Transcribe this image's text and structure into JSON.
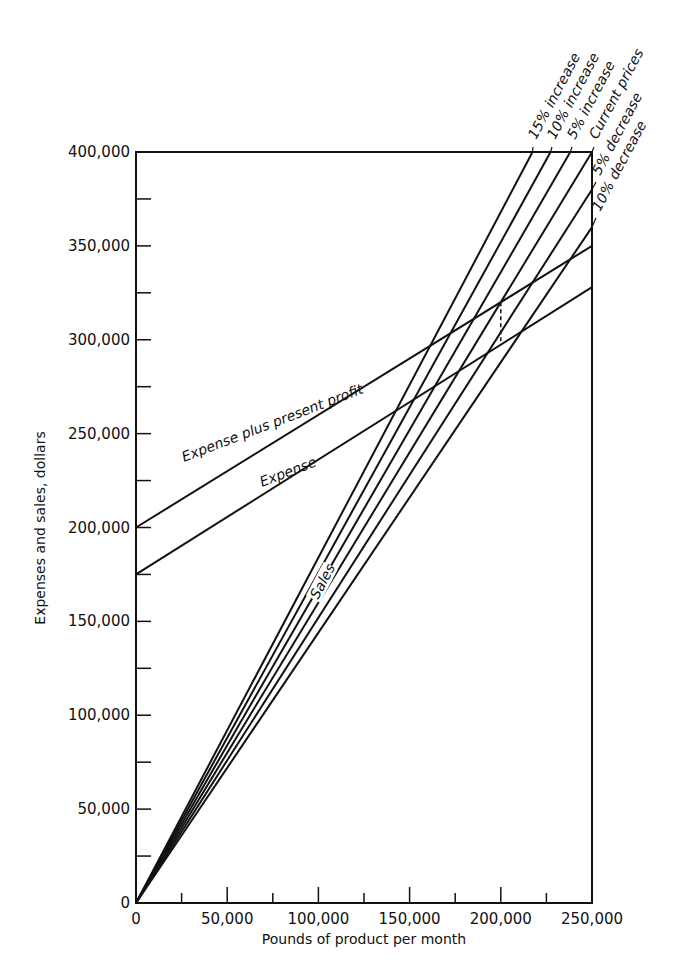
{
  "chart_data": {
    "type": "line",
    "title": "",
    "xlabel": "Pounds of product per month",
    "ylabel": "Expenses and sales, dollars",
    "xlim": [
      0,
      250000
    ],
    "ylim": [
      0,
      400000
    ],
    "grid": false,
    "x_ticks_major": [
      0,
      50000,
      100000,
      150000,
      200000,
      250000
    ],
    "x_tick_labels": [
      "0",
      "50,000",
      "100,000",
      "150,000",
      "200,000",
      "250,000"
    ],
    "x_ticks_minor": [
      25000,
      75000,
      125000,
      175000,
      225000
    ],
    "y_ticks_major": [
      0,
      50000,
      100000,
      150000,
      200000,
      250000,
      300000,
      350000,
      400000
    ],
    "y_tick_labels": [
      "0",
      "50,000",
      "100,000",
      "150,000",
      "200,000",
      "250,000",
      "300,000",
      "350,000",
      "400,000"
    ],
    "y_ticks_minor": [
      25000,
      75000,
      125000,
      175000,
      225000,
      275000,
      325000,
      375000
    ],
    "series": [
      {
        "name": "15% increase",
        "group": "Sales",
        "x": [
          0,
          217391
        ],
        "y": [
          0,
          400000
        ]
      },
      {
        "name": "10% increase",
        "group": "Sales",
        "x": [
          0,
          227273
        ],
        "y": [
          0,
          400000
        ]
      },
      {
        "name": "5% increase",
        "group": "Sales",
        "x": [
          0,
          238095
        ],
        "y": [
          0,
          400000
        ]
      },
      {
        "name": "Current prices",
        "group": "Sales",
        "x": [
          0,
          250000
        ],
        "y": [
          0,
          400000
        ]
      },
      {
        "name": "5% decrease",
        "group": "Sales",
        "x": [
          0,
          250000
        ],
        "y": [
          0,
          380000
        ]
      },
      {
        "name": "10% decrease",
        "group": "Sales",
        "x": [
          0,
          250000
        ],
        "y": [
          0,
          360000
        ]
      },
      {
        "name": "Expense plus present profit",
        "x": [
          0,
          250000
        ],
        "y": [
          200000,
          350000
        ]
      },
      {
        "name": "Expense",
        "x": [
          0,
          250000
        ],
        "y": [
          175000,
          328000
        ]
      }
    ],
    "annotations": [
      {
        "text": "Sales",
        "target": "sales line group"
      },
      {
        "text": "Expense plus present profit",
        "target": "Expense plus present profit"
      },
      {
        "text": "Expense",
        "target": "Expense"
      },
      {
        "type": "dashed-vertical",
        "x": 200000,
        "y": [
          299000,
          320000
        ],
        "meaning": "present profit at 200,000 lb"
      }
    ],
    "legend": "inline labels at upper right, rotated along lines"
  },
  "labels": {
    "sales": "Sales",
    "expense_plus_profit": "Expense plus present profit",
    "expense": "Expense",
    "price_lines": [
      "15% increase",
      "10% increase",
      "5% increase",
      "Current prices",
      "5% decrease",
      "10% decrease"
    ]
  }
}
